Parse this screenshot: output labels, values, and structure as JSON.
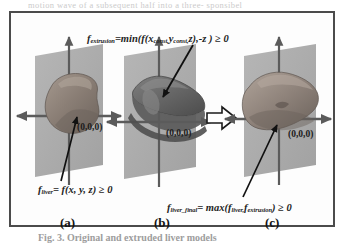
{
  "figure": {
    "bleed_text": "motion  wave  of a subsequent  half into  a  three-   sponsibel",
    "caption": "Fig. 3.  Original  and  extruded  liver  models",
    "panels": [
      {
        "id": "a",
        "letter": "(a)",
        "origin_label": "(0,0,0)",
        "shape_name": "liver-model",
        "shape_fill": "#8a7f78",
        "plane_fill": "#a9a9a9"
      },
      {
        "id": "b",
        "letter": "(b)",
        "origin_label": "(0,0,0)",
        "shape_name": "extrusion-model",
        "shape_fill": "#6f6f6f",
        "plane_fill": "#a9a9a9"
      },
      {
        "id": "c",
        "letter": "(c)",
        "origin_label": "(0,0,0)",
        "shape_name": "liver-final-model",
        "shape_fill": "#8a7f78",
        "plane_fill": "#a9a9a9"
      }
    ],
    "formulas": {
      "extrusion": {
        "lhs": "f",
        "lhs_sub": "extrusion",
        "eq": "=min(f(x",
        "sub1": "const,",
        "mid": "y",
        "sub2": "const,",
        "tail": "z),-z ) ≥ 0",
        "plain": "f_extrusion = min(f(x_const, y_const, z), -z) ≥ 0"
      },
      "liver": {
        "lhs": "f",
        "lhs_sub": "liver",
        "tail": "= f(x, y, z) ≥ 0",
        "plain": "f_liver = f(x, y, z) ≥ 0"
      },
      "final": {
        "lhs": "f",
        "lhs_sub": "liver_final",
        "eq": "= max(f",
        "sub1": "liver,",
        "mid": "f",
        "sub2": "extrusion",
        "tail": ") ≥ 0",
        "plain": "f_liver_final = max(f_liver, f_extrusion) ≥ 0"
      }
    },
    "arrows": {
      "extrusion_pointer": "arrow-from-extrusion-formula-to-panel-b",
      "liver_pointer": "arrow-from-liver-formula-to-panel-a",
      "final_pointer": "arrow-from-final-formula-to-panel-c",
      "transform": "right-arrow-between-panel-b-and-c"
    },
    "colors": {
      "frame": "#4b4b4b",
      "plane": "#a9a9a9",
      "axis": "#5b5b5b",
      "shape_light": "#9a8d84",
      "shape_dark": "#6f6f6f",
      "text": "#1d1d1d"
    }
  }
}
